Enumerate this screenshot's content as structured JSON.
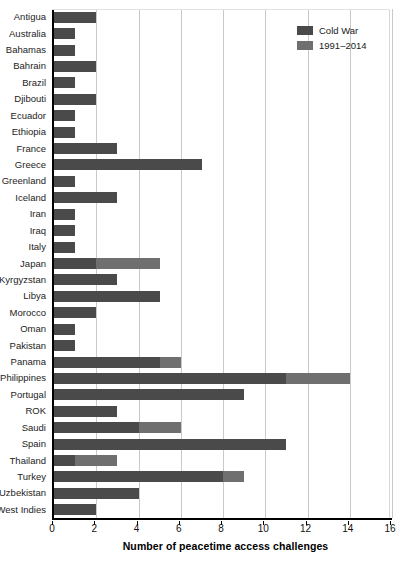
{
  "chart_data": {
    "type": "bar",
    "orientation": "horizontal",
    "stacked": true,
    "title": "",
    "xlabel": "Number of peacetime access challenges",
    "ylabel": "",
    "xlim": [
      0,
      16
    ],
    "xticks": [
      0,
      2,
      4,
      6,
      8,
      10,
      12,
      14,
      16
    ],
    "grid": "vertical",
    "legend_position": "top-right",
    "categories": [
      "Antigua",
      "Australia",
      "Bahamas",
      "Bahrain",
      "Brazil",
      "Djibouti",
      "Ecuador",
      "Ethiopia",
      "France",
      "Greece",
      "Greenland",
      "Iceland",
      "Iran",
      "Iraq",
      "Italy",
      "Japan",
      "Kyrgyzstan",
      "Libya",
      "Morocco",
      "Oman",
      "Pakistan",
      "Panama",
      "Philippines",
      "Portugal",
      "ROK",
      "Saudi",
      "Spain",
      "Thailand",
      "Turkey",
      "Uzbekistan",
      "West Indies"
    ],
    "series": [
      {
        "name": "Cold War",
        "color": "#4a4a4a",
        "values": [
          2,
          1,
          1,
          2,
          1,
          2,
          1,
          1,
          3,
          7,
          1,
          3,
          1,
          1,
          1,
          2,
          3,
          5,
          2,
          1,
          1,
          5,
          11,
          9,
          3,
          4,
          11,
          1,
          8,
          4,
          2
        ]
      },
      {
        "name": "1991–2014",
        "color": "#6f6f6f",
        "values": [
          0,
          0,
          0,
          0,
          0,
          0,
          0,
          0,
          0,
          0,
          0,
          0,
          0,
          0,
          0,
          3,
          0,
          0,
          0,
          0,
          0,
          1,
          3,
          0,
          0,
          2,
          0,
          2,
          1,
          0,
          0
        ]
      }
    ],
    "totals": [
      2,
      1,
      1,
      2,
      1,
      2,
      1,
      1,
      3,
      7,
      1,
      3,
      1,
      1,
      1,
      5,
      3,
      5,
      2,
      1,
      1,
      6,
      14,
      9,
      3,
      6,
      11,
      3,
      9,
      4,
      2
    ]
  },
  "legend": {
    "items": [
      {
        "label": "Cold War",
        "color": "#4a4a4a"
      },
      {
        "label": "1991–2014",
        "color": "#6f6f6f"
      }
    ]
  },
  "colors": {
    "cold_war": "#4a4a4a",
    "post_1991": "#6f6f6f",
    "grid": "#c9c9c9",
    "axis": "#000000",
    "background": "#ffffff"
  }
}
